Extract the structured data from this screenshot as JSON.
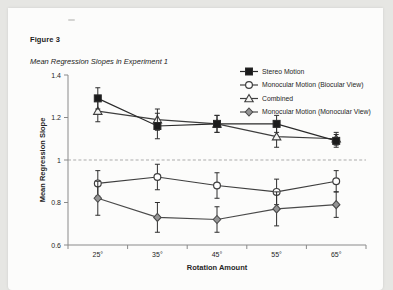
{
  "page": {
    "figure_label": "Figure 3",
    "figure_title": "Mean Regression Slopes in Experiment 1"
  },
  "chart_data": {
    "type": "line",
    "title": "",
    "xlabel": "Rotation Amount",
    "ylabel": "Mean Regression Slope",
    "categories": [
      "25°",
      "35°",
      "45°",
      "55°",
      "65°"
    ],
    "ylim": [
      0.6,
      1.4
    ],
    "yticks": {
      "values": [
        1.4,
        1.2,
        1.0,
        0.8,
        0.6
      ],
      "labels": [
        "1.4",
        "1.2",
        "1",
        "0.8",
        "0.6"
      ]
    },
    "reference_line": {
      "y": 1.0,
      "style": "dashed",
      "color": "#ababab"
    },
    "grid": false,
    "legend_position": "top-right",
    "error_bars": true,
    "series": [
      {
        "name": "Stereo Motion",
        "marker": "filled-square",
        "color": "#2a2a2a",
        "fill": "#1b1b1b",
        "values": [
          1.29,
          1.16,
          1.17,
          1.17,
          1.09
        ],
        "errors": [
          0.05,
          0.06,
          0.04,
          0.04,
          0.03
        ]
      },
      {
        "name": "Monocular Motion (Biocular View)",
        "marker": "open-circle",
        "color": "#3e3e3e",
        "fill": "#ffffff",
        "values": [
          0.89,
          0.92,
          0.88,
          0.85,
          0.9
        ],
        "errors": [
          0.06,
          0.06,
          0.06,
          0.06,
          0.05
        ]
      },
      {
        "name": "Combined",
        "marker": "open-triangle",
        "color": "#3e3e3e",
        "fill": "#f4f4f2",
        "values": [
          1.23,
          1.19,
          1.17,
          1.11,
          1.1
        ],
        "errors": [
          0.05,
          0.05,
          0.04,
          0.05,
          0.03
        ]
      },
      {
        "name": "Monocular Motion (Monocular View)",
        "marker": "filled-diamond",
        "color": "#4a4a4a",
        "fill": "#959595",
        "values": [
          0.82,
          0.73,
          0.72,
          0.77,
          0.79
        ],
        "errors": [
          0.08,
          0.07,
          0.06,
          0.08,
          0.06
        ]
      }
    ]
  },
  "style": {
    "page_bg": "#fcfcfb",
    "backdrop": "#e6e6e3",
    "axis_color": "#8a8a8a",
    "error_bar_color": "#2e2e2e",
    "text_color": "#262626"
  }
}
